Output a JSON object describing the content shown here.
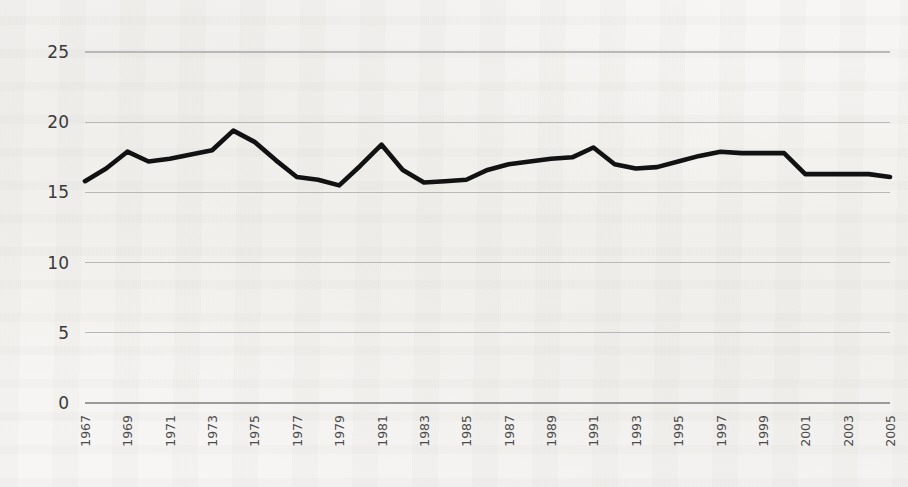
{
  "chart_data": {
    "type": "line",
    "title": "",
    "subtitle": "",
    "xlabel": "",
    "ylabel": "",
    "xlim": [
      1967,
      2005
    ],
    "ylim": [
      0,
      25
    ],
    "yticks": [
      0,
      5,
      10,
      15,
      20,
      25
    ],
    "ytick_labels": [
      "0",
      "5",
      "10",
      "15",
      "20",
      "25"
    ],
    "xticks": [
      1967,
      1969,
      1971,
      1973,
      1975,
      1977,
      1979,
      1981,
      1983,
      1985,
      1987,
      1989,
      1991,
      1993,
      1995,
      1997,
      1999,
      2001,
      2003,
      2005
    ],
    "xtick_labels": [
      "1967",
      "1969",
      "1971",
      "1973",
      "1975",
      "1977",
      "1979",
      "1981",
      "1983",
      "1985",
      "1987",
      "1989",
      "1991",
      "1993",
      "1995",
      "1997",
      "1999",
      "2001",
      "2003",
      "2005"
    ],
    "xtick_rotation": -90,
    "grid": "horizontal",
    "legend": "none",
    "line_color": "#121212",
    "grid_color": "#b8b8b8",
    "background_color": "#f6f5f3",
    "x": [
      1967,
      1968,
      1969,
      1970,
      1971,
      1972,
      1973,
      1974,
      1975,
      1976,
      1977,
      1978,
      1979,
      1980,
      1981,
      1982,
      1983,
      1984,
      1985,
      1986,
      1987,
      1988,
      1989,
      1990,
      1991,
      1992,
      1993,
      1994,
      1995,
      1996,
      1997,
      1998,
      1999,
      2000,
      2001,
      2002,
      2003,
      2004,
      2005
    ],
    "series": [
      {
        "name": "series-1",
        "color": "#121212",
        "values": [
          15.8,
          16.7,
          17.9,
          17.2,
          17.4,
          17.7,
          18.0,
          19.4,
          18.6,
          17.3,
          16.1,
          15.9,
          15.5,
          16.9,
          18.4,
          16.6,
          15.7,
          15.8,
          15.9,
          16.6,
          17.0,
          17.2,
          17.4,
          17.5,
          18.2,
          17.0,
          16.7,
          16.8,
          17.2,
          17.6,
          17.9,
          17.8,
          17.8,
          17.8,
          16.3,
          16.3,
          16.3,
          16.3,
          16.1
        ]
      }
    ]
  }
}
